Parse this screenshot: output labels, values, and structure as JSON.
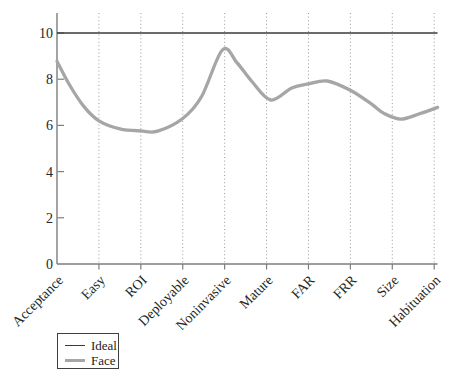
{
  "chart_data": {
    "type": "line",
    "title": "",
    "xlabel": "",
    "ylabel": "",
    "categories": [
      "Acceptance",
      "Easy",
      "ROI",
      "Deployable",
      "Noninvasive",
      "Mature",
      "FAR",
      "FRR",
      "Size",
      "Habituation"
    ],
    "series": [
      {
        "name": "Ideal",
        "values": [
          10,
          10,
          10,
          10,
          10,
          10,
          10,
          10,
          10,
          10
        ],
        "color": "#3a3a3a",
        "line_width": 1.7,
        "style": "solid-straight"
      },
      {
        "name": "Face",
        "values": [
          8.8,
          6.2,
          5.8,
          6.3,
          9.3,
          7.1,
          7.8,
          7.5,
          6.3,
          6.8
        ],
        "color": "#a6a6a6",
        "line_width": 3.3,
        "style": "smooth"
      }
    ],
    "face_curve_points": [
      [
        0,
        8.78
      ],
      [
        0.3,
        7.75
      ],
      [
        0.65,
        6.8
      ],
      [
        1,
        6.2
      ],
      [
        1.5,
        5.85
      ],
      [
        2,
        5.76
      ],
      [
        2.4,
        5.75
      ],
      [
        3,
        6.3
      ],
      [
        3.45,
        7.25
      ],
      [
        3.95,
        9.27
      ],
      [
        4.3,
        8.7
      ],
      [
        4.65,
        7.9
      ],
      [
        5.1,
        7.1
      ],
      [
        5.6,
        7.62
      ],
      [
        6,
        7.8
      ],
      [
        6.45,
        7.92
      ],
      [
        7,
        7.52
      ],
      [
        7.5,
        6.93
      ],
      [
        7.8,
        6.52
      ],
      [
        8.2,
        6.27
      ],
      [
        8.65,
        6.5
      ],
      [
        9.08,
        6.78
      ]
    ],
    "ylim": [
      0,
      10
    ],
    "yticks": [
      0,
      2,
      4,
      6,
      8,
      10
    ],
    "grid": {
      "vertical": true,
      "style": "dotted",
      "color": "#999999"
    },
    "axis_color": "#7d7d7d",
    "tick_label_color": "#262626",
    "legend": {
      "position": "bottom-left-outside",
      "entries": [
        "Ideal",
        "Face"
      ]
    }
  }
}
